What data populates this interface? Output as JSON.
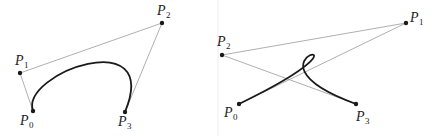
{
  "figures": [
    {
      "name": "cubic-bezier-simple",
      "points": [
        {
          "id": "P0",
          "letter": "P",
          "sub": "0",
          "x": 33,
          "y": 111,
          "lx": 20,
          "ly": 125
        },
        {
          "id": "P1",
          "letter": "P",
          "sub": "1",
          "x": 20,
          "y": 73,
          "lx": 15,
          "ly": 65
        },
        {
          "id": "P2",
          "letter": "P",
          "sub": "2",
          "x": 162,
          "y": 23,
          "lx": 157,
          "ly": 15
        },
        {
          "id": "P3",
          "letter": "P",
          "sub": "3",
          "x": 125,
          "y": 112,
          "lx": 118,
          "ly": 126
        }
      ],
      "polygon": "33,111 20,73 162,23 125,112",
      "curve": "M33,111 C20,73 162,23 125,112",
      "curve_style": "arc"
    },
    {
      "name": "cubic-bezier-loop",
      "points": [
        {
          "id": "P0",
          "letter": "P",
          "sub": "0",
          "x": 239,
          "y": 104,
          "lx": 224,
          "ly": 117
        },
        {
          "id": "P1",
          "letter": "P",
          "sub": "1",
          "x": 406,
          "y": 23,
          "lx": 410,
          "ly": 22
        },
        {
          "id": "P2",
          "letter": "P",
          "sub": "2",
          "x": 222,
          "y": 55,
          "lx": 217,
          "ly": 46
        },
        {
          "id": "P3",
          "letter": "P",
          "sub": "3",
          "x": 356,
          "y": 104,
          "lx": 356,
          "ly": 121
        }
      ],
      "polygon": "239,104 406,23 222,55 356,104",
      "curve": "M239,104 C406,23 222,55 356,104",
      "curve_style": "loop"
    }
  ],
  "colors": {
    "control_polygon": "#9a9a9a",
    "curve": "#1a1a1a",
    "background": "#ffffff"
  }
}
